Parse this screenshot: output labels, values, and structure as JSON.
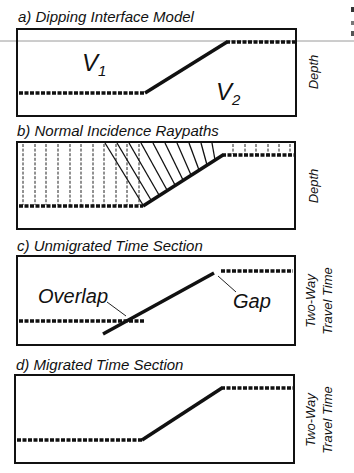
{
  "figure": {
    "panels": [
      {
        "id": "a",
        "title": "a) Dipping Interface Model",
        "axis_label_lines": [
          "Depth"
        ],
        "labels": {
          "v1": "V",
          "v1_sub": "1",
          "v2": "V",
          "v2_sub": "2"
        }
      },
      {
        "id": "b",
        "title": "b) Normal Incidence Raypaths",
        "axis_label_lines": [
          "Depth"
        ]
      },
      {
        "id": "c",
        "title": "c) Unmigrated Time Section",
        "axis_label_lines": [
          "Two-Way",
          "Travel Time"
        ],
        "labels": {
          "overlap": "Overlap",
          "gap": "Gap"
        }
      },
      {
        "id": "d",
        "title": "d) Migrated Time Section",
        "axis_label_lines": [
          "Two-Way",
          "Travel Time"
        ]
      }
    ],
    "colors": {
      "ink": "#111111",
      "background": "#ffffff",
      "rule": "#9a9a9a"
    }
  }
}
